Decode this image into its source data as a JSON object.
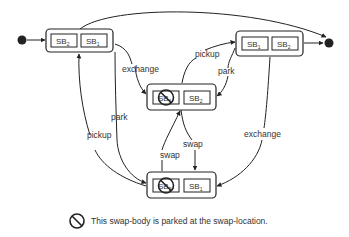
{
  "diagram": {
    "type": "state-machine",
    "colors": {
      "stroke": "#222222",
      "text": "#333333",
      "background": "#ffffff"
    },
    "states": [
      {
        "id": "A",
        "slots": [
          {
            "label": "SB",
            "sub": "2",
            "crossed": false
          },
          {
            "label": "SB",
            "sub": "1",
            "crossed": false
          }
        ]
      },
      {
        "id": "B",
        "slots": [
          {
            "label": "SB",
            "sub": "1",
            "crossed": false
          },
          {
            "label": "SB",
            "sub": "2",
            "crossed": false
          }
        ]
      },
      {
        "id": "C",
        "slots": [
          {
            "label": "SB",
            "sub": "1",
            "crossed": true
          },
          {
            "label": "SB",
            "sub": "2",
            "crossed": false
          }
        ]
      },
      {
        "id": "D",
        "slots": [
          {
            "label": "SB",
            "sub": "2",
            "crossed": true
          },
          {
            "label": "SB",
            "sub": "1",
            "crossed": false
          }
        ]
      }
    ],
    "transitions": [
      {
        "from": "initial",
        "to": "A",
        "label": ""
      },
      {
        "from": "A",
        "to": "final",
        "label": ""
      },
      {
        "from": "B",
        "to": "final",
        "label": ""
      },
      {
        "from": "A",
        "to": "C",
        "label": "exchange"
      },
      {
        "from": "C",
        "to": "B",
        "label": "pickup"
      },
      {
        "from": "B",
        "to": "C",
        "label": "park"
      },
      {
        "from": "A",
        "to": "D",
        "label": "park"
      },
      {
        "from": "D",
        "to": "A",
        "label": "pickup"
      },
      {
        "from": "D",
        "to": "C",
        "label": "swap"
      },
      {
        "from": "C",
        "to": "D",
        "label": "swap"
      },
      {
        "from": "B",
        "to": "D",
        "label": "exchange"
      }
    ],
    "labels": {
      "exchange_a_c": "exchange",
      "pickup_c_b": "pickup",
      "park_b_c": "park",
      "park_a_d": "park",
      "pickup_d_a": "pickup",
      "swap_d_c": "swap",
      "swap_c_d": "swap",
      "exchange_b_d": "exchange"
    },
    "legend": {
      "icon": "prohibited-icon",
      "text": "This swap-body is parked at the swap-location."
    }
  }
}
